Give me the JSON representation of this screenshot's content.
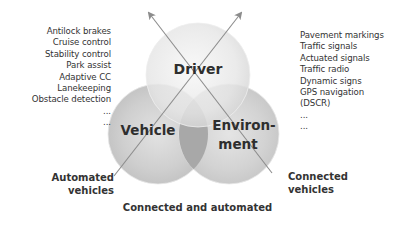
{
  "diagram": {
    "circles": [
      {
        "id": "driver",
        "label": "Driver",
        "cx": 198,
        "cy": 75,
        "r": 52
      },
      {
        "id": "vehicle",
        "label": "Vehicle",
        "cx": 158,
        "cy": 134,
        "r": 50
      },
      {
        "id": "environment",
        "label_line1": "Environ-",
        "label_line2": "ment",
        "cx": 229,
        "cy": 134,
        "r": 50
      }
    ],
    "vehicle_systems": [
      "Antilock brakes",
      "Cruise control",
      "Stability control",
      "Park assist",
      "Adaptive CC",
      "Lanekeeping",
      "Obstacle detection",
      "...",
      "..."
    ],
    "environment_systems": [
      "Pavement markings",
      "Traffic signals",
      "Actuated signals",
      "Traffic radio",
      "Dynamic signs",
      "GPS navigation",
      "(DSCR)",
      "...",
      "..."
    ],
    "automated_label_line1": "Automated",
    "automated_label_line2": "vehicles",
    "connected_label_line1": "Connected",
    "connected_label_line2": "vehicles",
    "bottom_label": "Connected and automated",
    "colors": {
      "circle_fill": "#c8c8c8",
      "overlap_dark": "#9a9a9a",
      "arrow": "#8c8c8c"
    }
  }
}
